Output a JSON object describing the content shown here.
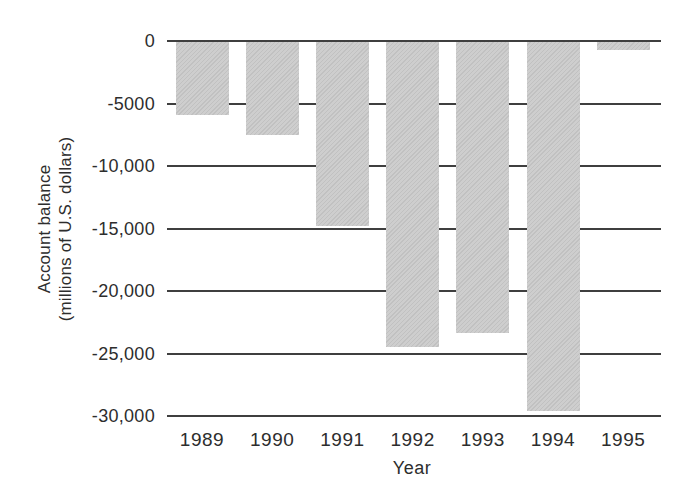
{
  "chart_data": {
    "type": "bar",
    "title": "",
    "xlabel": "Year",
    "ylabel": "Account balance (millions of U.S. dollars)",
    "ylabel_lines": [
      "Account balance",
      "(millions of U.S. dollars)"
    ],
    "categories": [
      "1989",
      "1990",
      "1991",
      "1992",
      "1993",
      "1994",
      "1995"
    ],
    "values": [
      -5800,
      -7400,
      -14700,
      -24400,
      -23300,
      -29500,
      -600
    ],
    "ylim": [
      -30000,
      0
    ],
    "yticks": [
      {
        "value": 0,
        "label": "0"
      },
      {
        "value": -5000,
        "label": "-5000"
      },
      {
        "value": -10000,
        "label": "-10,000"
      },
      {
        "value": -15000,
        "label": "-15,000"
      },
      {
        "value": -20000,
        "label": "-20,000"
      },
      {
        "value": -25000,
        "label": "-25,000"
      },
      {
        "value": -30000,
        "label": "-30,000"
      }
    ],
    "grid": true,
    "legend_position": "none",
    "colors": {
      "bar_fill": "#c9c9c9",
      "bar_hatch": "#c1c1c1",
      "gridline": "#3f3f3f",
      "text": "#2d2d2d",
      "background": "#ffffff"
    }
  }
}
